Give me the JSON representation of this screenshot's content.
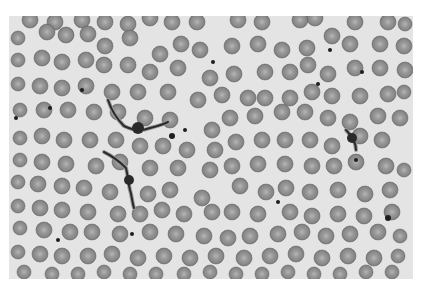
{
  "image": {
    "subject": "blood smear micrograph with red blood cells and trypanosome parasites",
    "colors": {
      "page_background": "#ffffff",
      "field_background": "#e4e4e4",
      "cell_edge": "#6f6f6f",
      "cell_body": "#8c8c8c",
      "cell_center": "#b4b4b4",
      "parasite": "#2a2a2a",
      "parasite_membrane": "#9a9a9a",
      "platelet": "#1e1e1e"
    },
    "field": {
      "x": 9,
      "y": 16,
      "width": 404,
      "height": 263
    },
    "cells": [
      [
        30,
        20,
        8
      ],
      [
        55,
        22,
        8
      ],
      [
        82,
        20,
        8
      ],
      [
        105,
        22,
        8
      ],
      [
        128,
        24,
        8
      ],
      [
        150,
        18,
        8
      ],
      [
        172,
        22,
        8
      ],
      [
        197,
        22,
        8
      ],
      [
        238,
        20,
        8
      ],
      [
        262,
        22,
        8
      ],
      [
        300,
        20,
        8
      ],
      [
        315,
        18,
        8
      ],
      [
        355,
        22,
        8
      ],
      [
        388,
        22,
        8
      ],
      [
        405,
        24,
        7
      ],
      [
        18,
        38,
        7
      ],
      [
        47,
        32,
        8
      ],
      [
        66,
        35,
        8
      ],
      [
        88,
        34,
        8
      ],
      [
        105,
        46,
        8
      ],
      [
        130,
        38,
        8
      ],
      [
        160,
        54,
        8
      ],
      [
        181,
        44,
        8
      ],
      [
        200,
        50,
        8
      ],
      [
        232,
        46,
        8
      ],
      [
        258,
        44,
        8
      ],
      [
        282,
        50,
        8
      ],
      [
        307,
        48,
        8
      ],
      [
        332,
        36,
        8
      ],
      [
        350,
        44,
        8
      ],
      [
        380,
        44,
        8
      ],
      [
        404,
        46,
        8
      ],
      [
        18,
        60,
        7
      ],
      [
        42,
        58,
        8
      ],
      [
        62,
        62,
        8
      ],
      [
        86,
        60,
        8
      ],
      [
        104,
        65,
        8
      ],
      [
        128,
        65,
        8
      ],
      [
        150,
        72,
        8
      ],
      [
        178,
        68,
        8
      ],
      [
        210,
        78,
        8
      ],
      [
        234,
        74,
        8
      ],
      [
        265,
        72,
        8
      ],
      [
        290,
        72,
        8
      ],
      [
        308,
        65,
        8
      ],
      [
        328,
        74,
        8
      ],
      [
        355,
        68,
        8
      ],
      [
        380,
        68,
        8
      ],
      [
        405,
        70,
        8
      ],
      [
        18,
        84,
        7
      ],
      [
        40,
        86,
        8
      ],
      [
        62,
        88,
        8
      ],
      [
        86,
        86,
        8
      ],
      [
        112,
        92,
        8
      ],
      [
        138,
        92,
        8
      ],
      [
        168,
        92,
        8
      ],
      [
        198,
        100,
        8
      ],
      [
        222,
        95,
        8
      ],
      [
        248,
        98,
        8
      ],
      [
        265,
        98,
        8
      ],
      [
        290,
        98,
        8
      ],
      [
        312,
        92,
        8
      ],
      [
        332,
        96,
        8
      ],
      [
        360,
        96,
        8
      ],
      [
        388,
        94,
        8
      ],
      [
        404,
        92,
        7
      ],
      [
        20,
        110,
        7
      ],
      [
        44,
        110,
        8
      ],
      [
        68,
        110,
        8
      ],
      [
        94,
        112,
        8
      ],
      [
        118,
        112,
        8
      ],
      [
        145,
        118,
        8
      ],
      [
        170,
        120,
        8
      ],
      [
        212,
        130,
        8
      ],
      [
        230,
        118,
        8
      ],
      [
        255,
        116,
        8
      ],
      [
        282,
        112,
        8
      ],
      [
        305,
        112,
        8
      ],
      [
        328,
        118,
        8
      ],
      [
        350,
        122,
        8
      ],
      [
        378,
        116,
        8
      ],
      [
        400,
        118,
        8
      ],
      [
        20,
        138,
        7
      ],
      [
        42,
        136,
        8
      ],
      [
        64,
        140,
        8
      ],
      [
        90,
        140,
        8
      ],
      [
        116,
        140,
        8
      ],
      [
        140,
        146,
        8
      ],
      [
        163,
        146,
        8
      ],
      [
        187,
        150,
        8
      ],
      [
        215,
        150,
        8
      ],
      [
        236,
        142,
        8
      ],
      [
        262,
        140,
        8
      ],
      [
        285,
        140,
        8
      ],
      [
        310,
        140,
        8
      ],
      [
        332,
        146,
        8
      ],
      [
        360,
        136,
        8
      ],
      [
        382,
        140,
        8
      ],
      [
        20,
        160,
        7
      ],
      [
        42,
        162,
        8
      ],
      [
        66,
        164,
        8
      ],
      [
        96,
        166,
        8
      ],
      [
        120,
        162,
        8
      ],
      [
        150,
        168,
        8
      ],
      [
        178,
        168,
        8
      ],
      [
        210,
        170,
        8
      ],
      [
        232,
        166,
        8
      ],
      [
        258,
        164,
        8
      ],
      [
        285,
        164,
        8
      ],
      [
        312,
        166,
        8
      ],
      [
        334,
        166,
        8
      ],
      [
        356,
        162,
        8
      ],
      [
        386,
        166,
        8
      ],
      [
        404,
        170,
        7
      ],
      [
        18,
        182,
        7
      ],
      [
        38,
        184,
        8
      ],
      [
        62,
        186,
        8
      ],
      [
        84,
        188,
        8
      ],
      [
        110,
        192,
        8
      ],
      [
        148,
        194,
        8
      ],
      [
        170,
        190,
        8
      ],
      [
        202,
        198,
        8
      ],
      [
        240,
        186,
        8
      ],
      [
        266,
        192,
        8
      ],
      [
        286,
        188,
        8
      ],
      [
        310,
        192,
        8
      ],
      [
        338,
        190,
        8
      ],
      [
        365,
        194,
        8
      ],
      [
        390,
        190,
        8
      ],
      [
        18,
        206,
        7
      ],
      [
        40,
        208,
        8
      ],
      [
        62,
        210,
        8
      ],
      [
        88,
        212,
        8
      ],
      [
        118,
        214,
        8
      ],
      [
        140,
        214,
        8
      ],
      [
        162,
        210,
        8
      ],
      [
        184,
        214,
        8
      ],
      [
        212,
        212,
        8
      ],
      [
        232,
        212,
        8
      ],
      [
        258,
        214,
        8
      ],
      [
        290,
        212,
        8
      ],
      [
        312,
        216,
        8
      ],
      [
        338,
        214,
        8
      ],
      [
        364,
        216,
        8
      ],
      [
        392,
        212,
        8
      ],
      [
        20,
        228,
        7
      ],
      [
        44,
        230,
        8
      ],
      [
        70,
        232,
        8
      ],
      [
        92,
        232,
        8
      ],
      [
        120,
        234,
        8
      ],
      [
        150,
        232,
        8
      ],
      [
        176,
        234,
        8
      ],
      [
        204,
        236,
        8
      ],
      [
        228,
        238,
        8
      ],
      [
        250,
        236,
        8
      ],
      [
        278,
        234,
        8
      ],
      [
        302,
        232,
        8
      ],
      [
        326,
        236,
        8
      ],
      [
        350,
        234,
        8
      ],
      [
        378,
        232,
        8
      ],
      [
        400,
        236,
        7
      ],
      [
        18,
        252,
        7
      ],
      [
        40,
        254,
        8
      ],
      [
        62,
        256,
        8
      ],
      [
        88,
        256,
        8
      ],
      [
        112,
        254,
        8
      ],
      [
        138,
        258,
        8
      ],
      [
        164,
        256,
        8
      ],
      [
        190,
        258,
        8
      ],
      [
        216,
        256,
        8
      ],
      [
        244,
        258,
        8
      ],
      [
        270,
        256,
        8
      ],
      [
        296,
        254,
        8
      ],
      [
        322,
        258,
        8
      ],
      [
        348,
        256,
        8
      ],
      [
        374,
        258,
        8
      ],
      [
        398,
        256,
        7
      ],
      [
        24,
        272,
        7
      ],
      [
        52,
        274,
        7
      ],
      [
        78,
        274,
        7
      ],
      [
        104,
        272,
        7
      ],
      [
        130,
        274,
        7
      ],
      [
        156,
        274,
        7
      ],
      [
        184,
        274,
        7
      ],
      [
        210,
        272,
        7
      ],
      [
        236,
        274,
        7
      ],
      [
        262,
        274,
        7
      ],
      [
        288,
        272,
        7
      ],
      [
        314,
        274,
        7
      ],
      [
        340,
        274,
        7
      ],
      [
        366,
        272,
        7
      ],
      [
        392,
        272,
        7
      ]
    ],
    "parasites": [
      {
        "path": "M108 100 C112 112, 118 120, 124 126 C132 130, 140 132, 150 128 C158 126, 164 124, 168 122",
        "nucleus": [
          138,
          128,
          6
        ]
      },
      {
        "path": "M126 168 C128 176, 128 182, 130 190 C132 196, 132 202, 134 208 M126 168 C118 160, 112 156, 104 152",
        "nucleus": [
          129,
          180,
          5
        ]
      },
      {
        "path": "M346 130 C352 136, 356 142, 356 150",
        "nucleus": [
          352,
          138,
          5
        ]
      }
    ],
    "platelets": [
      [
        82,
        90,
        2
      ],
      [
        50,
        108,
        2
      ],
      [
        16,
        118,
        2
      ],
      [
        213,
        62,
        2
      ],
      [
        185,
        130,
        2
      ],
      [
        172,
        136,
        3
      ],
      [
        132,
        234,
        2
      ],
      [
        58,
        240,
        2
      ],
      [
        330,
        50,
        2
      ],
      [
        362,
        72,
        2
      ],
      [
        278,
        202,
        2
      ],
      [
        388,
        218,
        3
      ],
      [
        356,
        160,
        2
      ],
      [
        318,
        84,
        2
      ]
    ]
  }
}
